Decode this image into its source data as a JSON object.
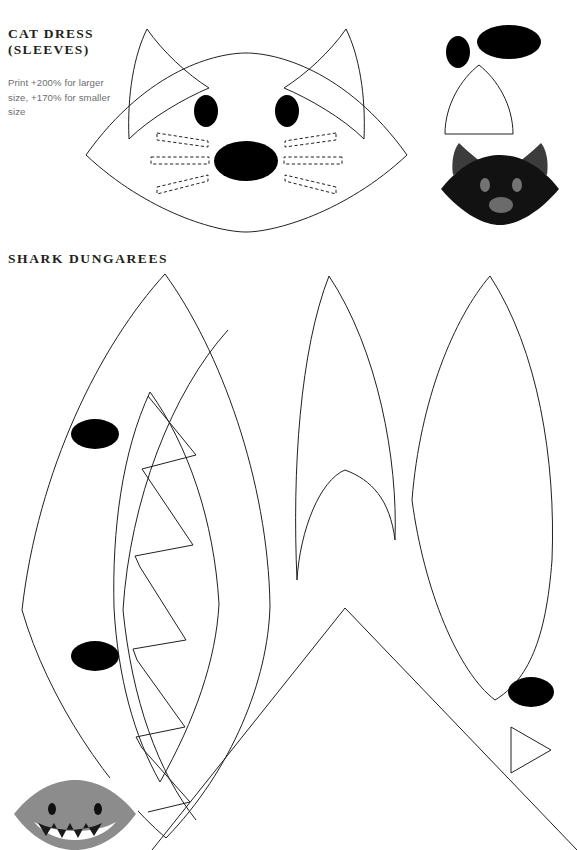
{
  "page": {
    "width": 577,
    "height": 850,
    "background": "#ffffff",
    "ink_color": "#231f20",
    "fill_color": "#000000",
    "instruction_color": "#6d6e71"
  },
  "sections": [
    {
      "id": "cat-dress",
      "title": "CAT DRESS\n(SLEEVES)",
      "instructions": "Print +200% for larger size, +170% for smaller size",
      "pieces": [
        "cat-face-mask",
        "cat-ear-left",
        "cat-ear-right",
        "cat-eye-left",
        "cat-eye-right",
        "cat-nose",
        "cat-whisker-left-upper",
        "cat-whisker-left-middle",
        "cat-whisker-left-lower",
        "cat-whisker-right-upper",
        "cat-whisker-right-middle",
        "cat-whisker-right-lower",
        "cat-eye-template",
        "cat-nose-template",
        "cat-ear-template"
      ],
      "preview": {
        "name": "cat-mask-photo",
        "description": "Finished black cat face mask with grey ears, eyes and nose",
        "colors": {
          "body": "#111111",
          "ear": "#3c3c3c",
          "feature": "#6f6f6f"
        }
      }
    },
    {
      "id": "shark-dungarees",
      "title": "SHARK DUNGAREES",
      "instructions": "",
      "pieces": [
        "shark-head-panel",
        "shark-eye-upper",
        "shark-eye-lower",
        "shark-mouth",
        "shark-teeth-zigzag",
        "shark-body-panel-middle",
        "shark-body-panel-right",
        "shark-tail-fin",
        "shark-eye-template",
        "shark-fin-template"
      ],
      "preview": {
        "name": "shark-bib-photo",
        "description": "Finished grey shark face with black eyes and white toothy mouth",
        "colors": {
          "body": "#8c8c8c",
          "mouth": "#ffffff",
          "teeth": "#1a1a1a",
          "eye": "#111111"
        }
      }
    }
  ],
  "counts": {
    "cat_whiskers_per_side": 3,
    "shark_teeth": 5,
    "shark_eyes": 2
  }
}
